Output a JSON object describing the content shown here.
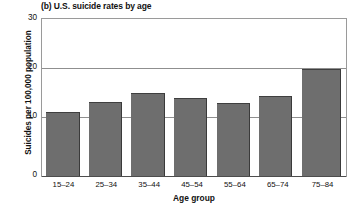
{
  "chart_data": {
    "type": "bar",
    "title": "(b) U.S. suicide rates by age",
    "xlabel": "Age group",
    "ylabel": "Suicides per 100,000 population",
    "categories": [
      "15–24",
      "25–34",
      "35–44",
      "45–54",
      "55–64",
      "65–74",
      "75–84"
    ],
    "values": [
      12.3,
      14.2,
      15.8,
      15.0,
      14.0,
      15.3,
      20.4
    ],
    "ylim": [
      0,
      30
    ],
    "yticks": [
      0,
      10,
      20,
      30
    ],
    "ytick_labels": [
      "0",
      "10",
      "20",
      "30"
    ],
    "grid": true,
    "grid_axis": "y",
    "legend": false,
    "bar_color": "#6e6e6e",
    "background_color": "#ffffff",
    "axis_color": "#8f8f8f"
  }
}
